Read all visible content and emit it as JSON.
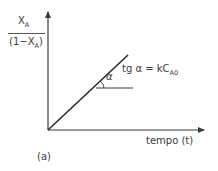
{
  "diagram": {
    "y_axis_label": {
      "numerator": "X",
      "numerator_sub": "A",
      "denominator_prefix": "(1−X",
      "denominator_sub": "A",
      "denominator_suffix": ")"
    },
    "x_axis_label": "tempo (t)",
    "angle_label": "α",
    "equation": {
      "prefix": "tg α = kC",
      "sub": "A0"
    },
    "panel_label": "(a)",
    "colors": {
      "axis": "#3a3a3a",
      "line": "#2a2a2a",
      "text": "#3a3a3a"
    },
    "geometry": {
      "origin": [
        48,
        130
      ],
      "y_axis_top": [
        48,
        8
      ],
      "x_axis_end": [
        208,
        130
      ],
      "line_end": [
        128,
        55
      ],
      "angle_ref_line": [
        [
          96,
          88
        ],
        [
          133,
          88
        ]
      ]
    }
  }
}
